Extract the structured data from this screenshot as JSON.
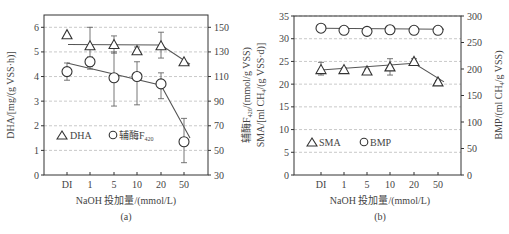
{
  "chart_data": [
    {
      "id": "a",
      "type": "scatter",
      "caption": "(a)",
      "xlabel": "NaOH 投加量/(mmol/L)",
      "categories": [
        "DI",
        "1",
        "5",
        "10",
        "20",
        "50"
      ],
      "left_axis": {
        "label": "DHA/[mg/(g VSS·h)]",
        "ylim": [
          0,
          6.6
        ],
        "ticks": [
          0,
          1,
          2,
          3,
          4,
          5,
          6
        ]
      },
      "right_axis": {
        "label": "辅酶F420/(mmol/g VSS)",
        "ylim": [
          30,
          160
        ],
        "ticks": [
          30,
          50,
          70,
          90,
          110,
          130,
          150
        ]
      },
      "grid": "horizontal dashed",
      "legend": [
        {
          "marker": "triangle",
          "label": "DHA"
        },
        {
          "marker": "circle",
          "label": "辅酶F",
          "sub": "420"
        }
      ],
      "series": [
        {
          "name": "DHA",
          "axis": "left",
          "marker": "triangle",
          "values": [
            5.7,
            5.25,
            5.3,
            5.05,
            5.25,
            4.6
          ],
          "err_low": [
            5.7,
            4.4,
            4.95,
            4.9,
            4.75,
            4.6
          ],
          "err_high": [
            5.7,
            6.0,
            5.65,
            5.2,
            5.8,
            4.6
          ],
          "fit_line": [
            [
              1,
              5.3
            ],
            [
              20,
              5.28
            ],
            [
              50,
              4.5
            ]
          ]
        },
        {
          "name": "辅酶F420",
          "axis": "right",
          "marker": "circle",
          "values": [
            114,
            122,
            109,
            110,
            104,
            57
          ],
          "err_low": [
            107,
            116,
            86,
            87,
            92,
            40
          ],
          "err_high": [
            121,
            126,
            130,
            122,
            113,
            76
          ],
          "fit_line": [
            [
              "DI",
              121
            ],
            [
              "20",
              103
            ],
            [
              "50",
              60
            ]
          ]
        }
      ]
    },
    {
      "id": "b",
      "type": "scatter",
      "caption": "(b)",
      "xlabel": "NaOH 投加量/(mmol/L)",
      "categories": [
        "DI",
        "1",
        "5",
        "10",
        "20",
        "50"
      ],
      "left_axis": {
        "label": "SMA/[ml CH4/(g VSS·d)]",
        "ylim": [
          0,
          35
        ],
        "ticks": [
          0,
          5,
          10,
          15,
          20,
          25,
          30,
          35
        ]
      },
      "right_axis": {
        "label": "BMP/(ml CH4/g VSS)",
        "ylim": [
          0,
          300
        ],
        "ticks": [
          0,
          50,
          100,
          150,
          200,
          250,
          300
        ]
      },
      "grid": "horizontal dashed",
      "legend": [
        {
          "marker": "triangle",
          "label": "SMA"
        },
        {
          "marker": "circle",
          "label": "BMP"
        }
      ],
      "series": [
        {
          "name": "SMA",
          "axis": "left",
          "marker": "triangle",
          "values": [
            23.2,
            23.2,
            22.9,
            23.8,
            25.0,
            20.5
          ],
          "err_low": [
            22.0,
            22.8,
            22.5,
            22.0,
            24.3,
            20.2
          ],
          "err_high": [
            24.8,
            23.6,
            23.3,
            25.6,
            25.6,
            20.8
          ],
          "fit_line": [
            [
              "DI",
              23.1
            ],
            [
              "20",
              24.6
            ],
            [
              "50",
              20.5
            ]
          ]
        },
        {
          "name": "BMP",
          "axis": "right",
          "marker": "circle",
          "values": [
            277,
            273,
            271,
            274,
            273,
            273
          ],
          "err_low": [
            272,
            268,
            266,
            269,
            271,
            270
          ],
          "err_high": [
            281,
            277,
            275,
            278,
            276,
            276
          ],
          "fit_line": [
            [
              "DI",
              277
            ],
            [
              "50",
              275
            ]
          ]
        }
      ]
    }
  ],
  "labels": {
    "a_left": "DHA/[mg/(g VSS·h)]",
    "a_right_main": "辅酶F",
    "a_right_sub": "420",
    "a_right_tail": "/(mmol/g VSS)",
    "a_x": "NaOH 投加量/(mmol/L)",
    "a_cap": "(a)",
    "a_leg1": "DHA",
    "a_leg2": "辅酶F",
    "a_leg2_sub": "420",
    "b_left": "SMA/[ml CH",
    "b_left_sub": "4",
    "b_left_tail": "/(g VSS·d)]",
    "b_right": "BMP/(ml CH",
    "b_right_sub": "4",
    "b_right_tail": "/g VSS)",
    "b_x": "NaOH 投加量/(mmol/L)",
    "b_cap": "(b)",
    "b_leg1": "SMA",
    "b_leg2": "BMP"
  }
}
